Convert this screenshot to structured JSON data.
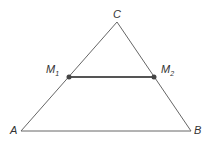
{
  "diagram": {
    "type": "triangle-midsegment",
    "colors": {
      "triangle": "#555555",
      "midsegment": "#555555",
      "point": "#444444",
      "label": "#333333"
    },
    "vertices": {
      "A": {
        "label": "A",
        "x": 21,
        "y": 131
      },
      "B": {
        "label": "B",
        "x": 191,
        "y": 131
      },
      "C": {
        "label": "C",
        "x": 117,
        "y": 22
      }
    },
    "midpoints": {
      "M1": {
        "label": "M",
        "subscript": "1",
        "x": 69,
        "y": 77
      },
      "M2": {
        "label": "M",
        "subscript": "2",
        "x": 154,
        "y": 77
      }
    }
  }
}
